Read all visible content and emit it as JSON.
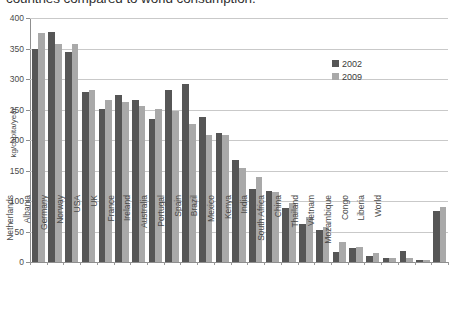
{
  "caption": {
    "text": "countries compared to world consumption."
  },
  "chart_data": {
    "type": "bar",
    "title": "",
    "xlabel": "",
    "ylabel": "kg/capita/year",
    "ylim": [
      0,
      400
    ],
    "ytick_step": 50,
    "ytick_labels": [
      "400",
      "350",
      "300",
      "250",
      "200",
      "150",
      "100",
      "50",
      "0"
    ],
    "grid": true,
    "legend_position": "top-right",
    "colors": {
      "2002": "#565656",
      "2009": "#a9a9a9"
    },
    "categories": [
      "Finland",
      "Sweden",
      "Netherlands",
      "Albania",
      "Germany",
      "Norway",
      "USA",
      "UK",
      "France",
      "Ireland",
      "Australia",
      "Portugal",
      "Spain",
      "Brazil",
      "Mexico",
      "Kenya",
      "India",
      "South Africa",
      "China",
      "Thailand",
      "Vietnam",
      "Mozambique",
      "Congo",
      "Liberia",
      "World"
    ],
    "series": [
      {
        "name": "2002",
        "values": [
          350,
          377,
          345,
          278,
          251,
          274,
          266,
          235,
          282,
          292,
          238,
          212,
          167,
          119,
          116,
          88,
          63,
          53,
          16,
          23,
          10,
          6,
          18,
          4,
          83
        ]
      },
      {
        "name": "2009",
        "values": [
          375,
          357,
          357,
          282,
          265,
          263,
          256,
          251,
          248,
          226,
          209,
          208,
          154,
          139,
          115,
          96,
          74,
          57,
          32,
          25,
          14,
          6,
          6,
          4,
          90
        ]
      }
    ]
  }
}
